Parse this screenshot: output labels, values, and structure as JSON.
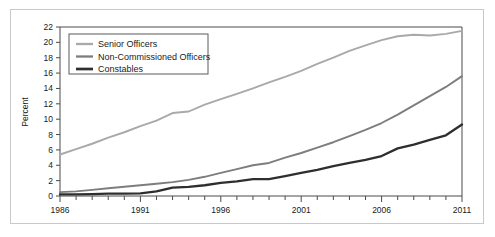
{
  "chart_data": {
    "type": "line",
    "title": "",
    "xlabel": "",
    "ylabel": "Percent",
    "xlim": [
      1986,
      2011
    ],
    "ylim": [
      0,
      22
    ],
    "grid": false,
    "legend_position": "top-left",
    "x": [
      1986,
      1987,
      1988,
      1989,
      1990,
      1991,
      1992,
      1993,
      1994,
      1995,
      1996,
      1997,
      1998,
      1999,
      2000,
      2001,
      2002,
      2003,
      2004,
      2005,
      2006,
      2007,
      2008,
      2009,
      2010,
      2011
    ],
    "x_tick_labels": [
      "1986",
      "1991",
      "1996",
      "2001",
      "2006",
      "2011"
    ],
    "x_tick_values": [
      1986,
      1991,
      1996,
      2001,
      2006,
      2011
    ],
    "y_tick_labels": [
      "0",
      "2",
      "4",
      "6",
      "8",
      "10",
      "12",
      "14",
      "16",
      "18",
      "20",
      "22"
    ],
    "y_tick_values": [
      0,
      2,
      4,
      6,
      8,
      10,
      12,
      14,
      16,
      18,
      20,
      22
    ],
    "series": [
      {
        "name": "Senior Officers",
        "color": "#a9a9a9",
        "width": 1.9,
        "values": [
          5.4,
          6.1,
          6.8,
          7.6,
          8.3,
          9.1,
          9.8,
          10.8,
          11.0,
          11.9,
          12.6,
          13.3,
          14.0,
          14.8,
          15.5,
          16.3,
          17.2,
          18.0,
          18.9,
          19.6,
          20.3,
          20.8,
          21.0,
          20.9,
          21.1,
          21.5
        ]
      },
      {
        "name": "Non-Commissioned Officers",
        "color": "#7d7d7d",
        "width": 1.9,
        "values": [
          0.5,
          0.6,
          0.8,
          1.0,
          1.2,
          1.4,
          1.6,
          1.8,
          2.1,
          2.5,
          3.0,
          3.5,
          4.0,
          4.3,
          5.0,
          5.6,
          6.3,
          7.0,
          7.8,
          8.6,
          9.5,
          10.6,
          11.8,
          13.0,
          14.2,
          15.6
        ]
      },
      {
        "name": "Constables",
        "color": "#2e2e2e",
        "width": 2.3,
        "values": [
          0.2,
          0.2,
          0.25,
          0.3,
          0.3,
          0.35,
          0.6,
          1.1,
          1.2,
          1.4,
          1.7,
          1.9,
          2.2,
          2.2,
          2.6,
          3.0,
          3.4,
          3.9,
          4.3,
          4.7,
          5.2,
          6.2,
          6.7,
          7.3,
          7.9,
          9.3
        ]
      }
    ]
  },
  "legend": {
    "items": [
      {
        "label": "Senior Officers"
      },
      {
        "label": "Non-Commissioned Officers"
      },
      {
        "label": "Constables"
      }
    ]
  }
}
